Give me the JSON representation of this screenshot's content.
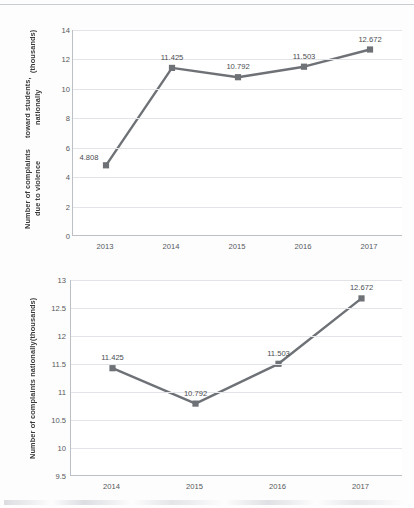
{
  "page": {
    "background_color": "#fdfdfd",
    "rule_color": "#c9ccd1"
  },
  "style": {
    "series_color": "#6e7176",
    "grid_color": "#e2e4e7",
    "axis_color": "#bcbfc4",
    "label_color": "#55585c"
  },
  "chart_data": [
    {
      "type": "line",
      "id": "chart-violence-toward-students",
      "title": "",
      "xlabel": "",
      "ylabel": "Number of complaints due to violence toward students, nationally (thousands)",
      "ylabel_lines": [
        "Number of complaints due to violence",
        "toward students, nationally",
        "(thousands)"
      ],
      "categories": [
        "2013",
        "2014",
        "2015",
        "2016",
        "2017"
      ],
      "values": [
        4.808,
        11.425,
        10.792,
        11.503,
        12.672
      ],
      "point_labels": [
        "4.808",
        "11.425",
        "10.792",
        "11.503",
        "12.672"
      ],
      "label_positions": [
        "left-above",
        "above",
        "above",
        "above",
        "above"
      ],
      "ylim": [
        0,
        14
      ],
      "yticks": [
        0,
        2,
        4,
        6,
        8,
        10,
        12,
        14
      ],
      "ytick_labels": [
        "0",
        "2",
        "4",
        "6",
        "8",
        "10",
        "12",
        "14"
      ],
      "grid": true,
      "legend": "none",
      "marker": "square"
    },
    {
      "type": "line",
      "id": "chart-complaints-nationally",
      "title": "",
      "xlabel": "",
      "ylabel": "Number of complaints nationally (thousands)",
      "ylabel_lines": [
        "Number of complaints nationally",
        "(thousands)"
      ],
      "categories": [
        "2014",
        "2015",
        "2016",
        "2017"
      ],
      "values": [
        11.425,
        10.792,
        11.503,
        12.672
      ],
      "point_labels": [
        "11.425",
        "10.792",
        "11.503",
        "12.672"
      ],
      "label_positions": [
        "above",
        "above",
        "above",
        "above"
      ],
      "ylim": [
        9.5,
        13
      ],
      "yticks": [
        9.5,
        10,
        10.5,
        11,
        11.5,
        12,
        12.5,
        13
      ],
      "ytick_labels": [
        "9.5",
        "10",
        "10.5",
        "11",
        "11.5",
        "12",
        "12.5",
        "13"
      ],
      "grid": true,
      "legend": "none",
      "marker": "square"
    }
  ]
}
